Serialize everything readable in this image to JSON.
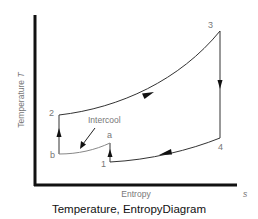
{
  "diagram": {
    "title": "Temperature, EntropyDiagram",
    "y_axis_label": "Temperature",
    "y_axis_symbol": "T",
    "x_axis_label": "Entropy",
    "x_axis_symbol": "s",
    "annotation": "Intercool",
    "points": [
      {
        "id": "1",
        "label": "1"
      },
      {
        "id": "a",
        "label": "a"
      },
      {
        "id": "b",
        "label": "b"
      },
      {
        "id": "2",
        "label": "2"
      },
      {
        "id": "3",
        "label": "3"
      },
      {
        "id": "4",
        "label": "4"
      }
    ],
    "colors": {
      "axis": "#111111",
      "curve": "#333333",
      "label": "#777777"
    }
  }
}
